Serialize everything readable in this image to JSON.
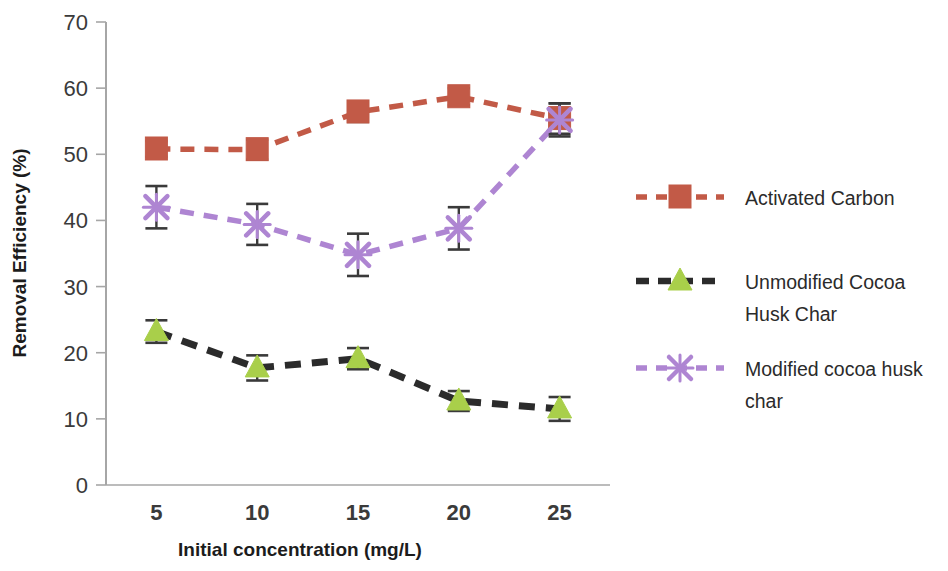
{
  "chart_data": {
    "type": "line",
    "title": "",
    "xlabel": "Initial concentration (mg/L)",
    "ylabel": "Removal Efficiency (%)",
    "categories": [
      5,
      10,
      15,
      20,
      25
    ],
    "xtick_labels": [
      "5",
      "10",
      "15",
      "20",
      "25"
    ],
    "ytick_labels": [
      "0",
      "10",
      "20",
      "30",
      "40",
      "50",
      "60",
      "70"
    ],
    "yticks": [
      0,
      10,
      20,
      30,
      40,
      50,
      60,
      70
    ],
    "ylim": [
      0,
      70
    ],
    "xlim": [
      2.5,
      27.5
    ],
    "grid": false,
    "legend_position": "right",
    "error_bars": true,
    "series": [
      {
        "name": "Activated Carbon",
        "color": "#C25A47",
        "marker": "square",
        "line_style": "dashed",
        "values": [
          50.8,
          50.7,
          56.4,
          58.7,
          55.4
        ],
        "errors": [
          1.2,
          1.5,
          1.5,
          1.3,
          2.3
        ]
      },
      {
        "name": "Unmodified Cocoa Husk Char",
        "color": "#A9CF4A",
        "line_color": "#2B2B2B",
        "marker": "triangle",
        "line_style": "dashed",
        "values": [
          23.2,
          17.7,
          19.1,
          12.7,
          11.5
        ],
        "errors": [
          1.7,
          1.9,
          1.6,
          1.5,
          1.8
        ]
      },
      {
        "name": "Modified cocoa husk char",
        "color": "#AE85D2",
        "marker": "x",
        "line_style": "dashed",
        "values": [
          42.0,
          39.4,
          34.8,
          38.8,
          55.2
        ],
        "errors": [
          3.2,
          3.1,
          3.2,
          3.2,
          2.5
        ]
      }
    ]
  },
  "legend": {
    "entries": [
      {
        "label": "Activated Carbon"
      },
      {
        "label": "Unmodified Cocoa\nHusk Char",
        "line1": "Unmodified Cocoa",
        "line2": "Husk Char"
      },
      {
        "label": "Modified cocoa husk\nchar",
        "line1": "Modified cocoa husk",
        "line2": "char"
      }
    ]
  },
  "axes": {
    "x_title": "Initial concentration (mg/L)",
    "y_title": "Removal Efficiency (%)"
  },
  "colors": {
    "activated_carbon": "#C25A47",
    "unmodified_marker": "#A9CF4A",
    "unmodified_line": "#2B2B2B",
    "modified": "#AE85D2",
    "axis": "#A6A6A6",
    "error_bar": "#3a3a3a",
    "text": "#2b2b2b"
  }
}
